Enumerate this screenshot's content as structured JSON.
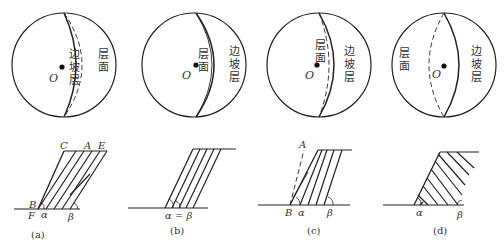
{
  "figure": {
    "panels": [
      {
        "id": "a",
        "caption": "(a)",
        "center_label": "O",
        "labels_cn": {
          "slope_layer": "边坡层",
          "bedding": "层面"
        },
        "points": {
          "C": "C",
          "A": "A",
          "E": "E",
          "B": "B",
          "F": "F"
        },
        "angles": {
          "alpha": "α",
          "beta": "β"
        }
      },
      {
        "id": "b",
        "caption": "(b)",
        "center_label": "O",
        "labels_cn": {
          "bedding": "层面",
          "slope_layer": "边坡层"
        },
        "angle_label": "α = β"
      },
      {
        "id": "c",
        "caption": "(c)",
        "center_label": "O",
        "labels_cn": {
          "bedding": "层面",
          "slope_layer": "边坡层"
        },
        "points": {
          "A": "A",
          "B": "B"
        },
        "angles": {
          "alpha": "α",
          "beta": "β"
        }
      },
      {
        "id": "d",
        "caption": "(d)",
        "center_label": "O",
        "labels_cn": {
          "bedding": "层面",
          "slope_layer": "边坡层"
        },
        "angles": {
          "alpha": "α",
          "beta": "β"
        }
      }
    ]
  }
}
